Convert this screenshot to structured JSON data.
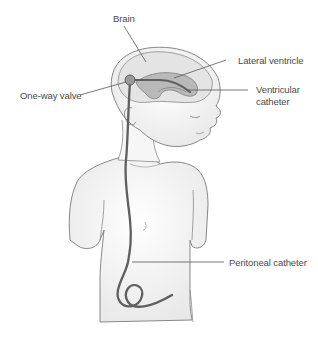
{
  "figure": {
    "labels": {
      "brain": "Brain",
      "lateral_ventricle": "Lateral ventricle",
      "one_way_valve": "One-way valve",
      "ventricular_catheter_line1": "Ventricular",
      "ventricular_catheter_line2": "catheter",
      "peritoneal_catheter": "Peritoneal catheter"
    },
    "colors": {
      "outline": "#6e6e6e",
      "skin_shade": "#eeeeee",
      "brain_fill": "#e2e2e2",
      "ventricle_fill": "#bdbdbd",
      "tube": "#666666",
      "label_text": "#4a4a4a",
      "leader_line": "#555555"
    }
  }
}
